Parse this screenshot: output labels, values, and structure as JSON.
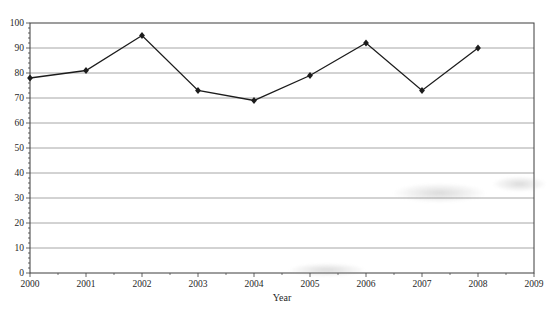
{
  "chart_data": {
    "type": "line",
    "title": "Number of Deaths 2000 - 2008",
    "xlabel": "Year",
    "ylabel": "",
    "x": [
      2000,
      2001,
      2002,
      2003,
      2004,
      2005,
      2006,
      2007,
      2008
    ],
    "values": [
      78,
      81,
      95,
      73,
      69,
      79,
      92,
      73,
      90
    ],
    "xlim": [
      2000,
      2009
    ],
    "ylim": [
      0,
      100
    ],
    "xtick_labels": [
      "2000",
      "2001",
      "2002",
      "2003",
      "2004",
      "2005",
      "2006",
      "2007",
      "2008",
      "2009"
    ],
    "ytick_labels": [
      "0",
      "10",
      "20",
      "30",
      "40",
      "50",
      "60",
      "70",
      "80",
      "90",
      "100"
    ],
    "grid": "horizontal",
    "legend": "none",
    "marker": "diamond",
    "colors": {
      "line": "#1c1c1c",
      "marker": "#1c1c1c",
      "grid": "#8f8f8f",
      "axis": "#3c3c3c",
      "text": "#1f1f1f",
      "background": "#ffffff"
    }
  }
}
